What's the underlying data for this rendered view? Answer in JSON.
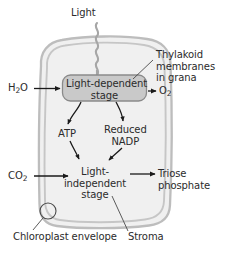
{
  "diagram": {
    "colors": {
      "membrane_stroke": "#b9b9b9",
      "membrane_fill": "#f0f0f0",
      "stage_box_fill": "#c9c9c9",
      "stage_box_stroke": "#8a8a8a",
      "text": "#2b2b2b",
      "arrow": "#1a1a1a",
      "light_arrow": "#9a9a9a",
      "leader_line": "#4a4a4a",
      "background": "#ffffff"
    },
    "inputs": {
      "light": "Light",
      "water": "H₂O",
      "water_formula": {
        "text": "H",
        "sub": "2",
        "tail": "O"
      },
      "carbon_dioxide": "CO₂",
      "carbon_dioxide_formula": {
        "text": "CO",
        "sub": "2",
        "tail": ""
      }
    },
    "outputs": {
      "oxygen": "O₂",
      "oxygen_formula": {
        "text": "O",
        "sub": "2",
        "tail": ""
      },
      "triose_phosphate_line1": "Triose",
      "triose_phosphate_line2": "phosphate"
    },
    "stages": {
      "light_dependent_line1": "Light-dependent",
      "light_dependent_line2": "stage",
      "light_independent_line1": "Light-",
      "light_independent_line2": "independent",
      "light_independent_line3": "stage"
    },
    "intermediates": {
      "atp": "ATP",
      "reduced_nadp_line1": "Reduced",
      "reduced_nadp_line2": "NADP"
    },
    "annotations": {
      "thylakoid_line1": "Thylakoid",
      "thylakoid_line2": "membranes",
      "thylakoid_line3": "in grana",
      "stroma": "Stroma",
      "chloroplast_envelope": "Chloroplast envelope"
    }
  }
}
